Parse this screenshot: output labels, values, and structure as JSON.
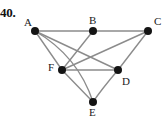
{
  "figure": {
    "problem_number": "40.",
    "width": 166,
    "height": 119,
    "background_color": "#ffffff",
    "edge_color": "#8c8c8c",
    "vertex_color": "#141414",
    "label_color": "#1a1a1a"
  },
  "graph": {
    "type": "undirected-graph",
    "vertices": [
      {
        "id": "A",
        "label": "A",
        "x": 35,
        "y": 31,
        "label_x": 24,
        "label_y": 17
      },
      {
        "id": "B",
        "label": "B",
        "x": 93,
        "y": 31,
        "label_x": 89,
        "label_y": 15
      },
      {
        "id": "C",
        "label": "C",
        "x": 148,
        "y": 31,
        "label_x": 154,
        "label_y": 16
      },
      {
        "id": "D",
        "label": "D",
        "x": 118,
        "y": 70,
        "label_x": 122,
        "label_y": 76
      },
      {
        "id": "E",
        "label": "E",
        "x": 93,
        "y": 102,
        "label_x": 89,
        "label_y": 107
      },
      {
        "id": "F",
        "label": "F",
        "x": 62,
        "y": 70,
        "label_x": 48,
        "label_y": 62
      }
    ],
    "edges": [
      {
        "from": "A",
        "to": "B",
        "shape": "line"
      },
      {
        "from": "B",
        "to": "C",
        "shape": "line"
      },
      {
        "from": "A",
        "to": "D",
        "shape": "line"
      },
      {
        "from": "A",
        "to": "F",
        "shape": "line"
      },
      {
        "from": "A",
        "to": "E",
        "shape": "curve",
        "control_x": 78,
        "control_y": 56
      },
      {
        "from": "B",
        "to": "F",
        "shape": "line"
      },
      {
        "from": "C",
        "to": "D",
        "shape": "line"
      },
      {
        "from": "C",
        "to": "F",
        "shape": "line"
      },
      {
        "from": "F",
        "to": "D",
        "shape": "line"
      },
      {
        "from": "F",
        "to": "E",
        "shape": "line"
      },
      {
        "from": "D",
        "to": "E",
        "shape": "curve",
        "control_x": 101,
        "control_y": 90
      }
    ],
    "vertex_radius": 4
  }
}
